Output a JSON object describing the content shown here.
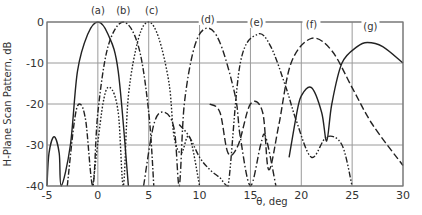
{
  "chart_data": {
    "type": "line",
    "title": "",
    "xlabel": "θ, deg",
    "ylabel": "H-Plane Scan Pattern, dB",
    "xlim": [
      -5,
      30
    ],
    "ylim": [
      -40,
      0
    ],
    "xticks": [
      "-5",
      "0",
      "5",
      "10",
      "15",
      "20",
      "25",
      "30"
    ],
    "yticks": [
      "0",
      "-10",
      "-20",
      "-30",
      "-40"
    ],
    "grid": true,
    "legend_position": "inline labels above peaks",
    "series": [
      {
        "name": "(a)",
        "style": "solid",
        "peak_deg": 0,
        "peak_db": 0,
        "x": [
          -5,
          -4.8,
          -4.3,
          -3.8,
          -3.6,
          -2.7,
          -2,
          -1,
          0,
          1,
          2,
          3
        ],
        "y": [
          -40,
          -32,
          -28,
          -32,
          -40,
          -30,
          -12,
          -3,
          0,
          -3,
          -12,
          -40
        ]
      },
      {
        "name": "(b)",
        "style": "dash-dot (sparse)",
        "peak_deg": 2.5,
        "peak_db": 0,
        "x": [
          -3,
          -2.3,
          -1.8,
          -1.2,
          -0.5,
          0,
          1,
          2.5,
          4,
          5,
          5.5
        ],
        "y": [
          -40,
          -24,
          -20,
          -24,
          -40,
          -22,
          -6,
          0,
          -6,
          -22,
          -40
        ]
      },
      {
        "name": "(c)",
        "style": "dotted",
        "peak_deg": 5,
        "peak_db": 0,
        "x": [
          -0.5,
          0.5,
          1.2,
          2,
          2.5,
          3,
          4,
          5,
          6,
          7,
          7.5,
          8.2,
          9,
          10
        ],
        "y": [
          -40,
          -20,
          -16,
          -22,
          -40,
          -18,
          -4,
          0,
          -4,
          -15,
          -28,
          -32,
          -28,
          -40
        ]
      },
      {
        "name": "(d)",
        "style": "dash-dot",
        "peak_deg": 10.7,
        "peak_db": -1.5,
        "x": [
          4.5,
          5.5,
          6.5,
          7.5,
          8,
          8.5,
          9.5,
          10.7,
          12,
          13.5,
          14,
          15,
          16,
          16.5,
          17.5
        ],
        "y": [
          -40,
          -25,
          -22,
          -26,
          -40,
          -20,
          -6,
          -1.5,
          -5,
          -18,
          -28,
          -40,
          -30,
          -28,
          -40
        ]
      },
      {
        "name": "(e)",
        "style": "dash-dot-dot",
        "peak_deg": 15.7,
        "peak_db": -3,
        "x": [
          8,
          9,
          10,
          11,
          12,
          12.8,
          14,
          15.7,
          17,
          18.5,
          19.5,
          21,
          22.5,
          24,
          25
        ],
        "y": [
          -25,
          -28,
          -33,
          -36,
          -38,
          -40,
          -10,
          -3,
          -6,
          -16,
          -24,
          -33,
          -28,
          -30,
          -40
        ]
      },
      {
        "name": "(f)",
        "style": "dashed",
        "peak_deg": 21,
        "peak_db": -4,
        "x": [
          11,
          12,
          12.8,
          13.8,
          15,
          16.2,
          16.8,
          17.8,
          19,
          21,
          23,
          25,
          27,
          30
        ],
        "y": [
          -20,
          -22,
          -32,
          -30,
          -20,
          -22,
          -36,
          -25,
          -10,
          -4,
          -7,
          -16,
          -25,
          -35
        ]
      },
      {
        "name": "(g)",
        "style": "solid",
        "peak_deg": 26.5,
        "peak_db": -5,
        "x": [
          18.8,
          19.5,
          20,
          21,
          22,
          22.5,
          23,
          24,
          25.5,
          26.5,
          28,
          30
        ],
        "y": [
          -33,
          -23,
          -18,
          -16,
          -22,
          -29,
          -20,
          -10,
          -6,
          -5,
          -6,
          -10
        ]
      }
    ]
  },
  "axes": {
    "xlabel": "θ, deg",
    "ylabel": "H-Plane Scan Pattern, dB",
    "x_ticks": [
      "-5",
      "0",
      "5",
      "10",
      "15",
      "20",
      "25",
      "30"
    ],
    "y_ticks": [
      "0",
      "-10",
      "-20",
      "-30",
      "-40"
    ]
  },
  "labels": [
    "(a)",
    "(b)",
    "(c)",
    "(d)",
    "(e)",
    "(f)",
    "(g)"
  ]
}
